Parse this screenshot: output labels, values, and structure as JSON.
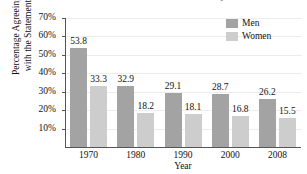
{
  "chart_data": {
    "type": "bar",
    "title": "are best exhibited in the home and family.",
    "xlabel": "Year",
    "ylabel_lines": [
      "Percentage Agreeing",
      "with the Statement"
    ],
    "categories": [
      "1970",
      "1980",
      "1990",
      "2000",
      "2008"
    ],
    "series": [
      {
        "name": "Men",
        "color": "#a3a3a3",
        "values": [
          53.8,
          32.9,
          29.1,
          28.7,
          26.2
        ]
      },
      {
        "name": "Women",
        "color": "#cdcdcd",
        "values": [
          33.3,
          18.2,
          18.1,
          16.8,
          15.5
        ]
      }
    ],
    "ylim": [
      0,
      70
    ],
    "yticks": [
      10,
      20,
      30,
      40,
      50,
      60,
      70
    ],
    "ytick_labels": [
      "10%",
      "20%",
      "30%",
      "40%",
      "50%",
      "60%",
      "70%"
    ],
    "grid": true,
    "legend_position": "top-right"
  }
}
